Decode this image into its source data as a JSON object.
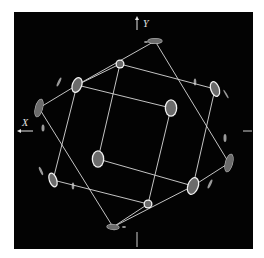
{
  "figure": {
    "background": "#ffffff",
    "panel": {
      "x": 14,
      "y": 12,
      "width": 239,
      "height": 237,
      "color": "#030303"
    },
    "axes": {
      "y": {
        "label": "Y",
        "arrow_x": 137,
        "arrow_y1": 30,
        "arrow_y2": 16,
        "label_x": 143,
        "label_y": 27
      },
      "x": {
        "label": "X",
        "arrow_y": 131,
        "arrow_x1": 33,
        "arrow_x2": 17,
        "label_x": 22,
        "label_y": 126
      },
      "ticks": [
        {
          "x1": 137,
          "y1": 232,
          "x2": 137,
          "y2": 247
        },
        {
          "x1": 243,
          "y1": 131,
          "x2": 252,
          "y2": 131
        }
      ]
    },
    "colors": {
      "line": "#d9d9d9",
      "spot_fill": "#6b6b6b",
      "spot_ring": "#f2f2f2",
      "faint": "#9a9a9a"
    },
    "lines": [
      [
        155,
        41,
        77,
        85
      ],
      [
        77,
        85,
        39,
        108
      ],
      [
        155,
        41,
        229,
        163
      ],
      [
        229,
        163,
        193,
        186
      ],
      [
        193,
        186,
        113,
        227
      ],
      [
        39,
        108,
        113,
        227
      ],
      [
        120,
        64,
        215,
        89
      ],
      [
        120,
        64,
        77,
        85
      ],
      [
        120,
        64,
        98,
        159
      ],
      [
        215,
        89,
        193,
        186
      ],
      [
        77,
        85,
        171,
        108
      ],
      [
        77,
        85,
        53,
        180
      ],
      [
        171,
        108,
        148,
        204
      ],
      [
        98,
        159,
        193,
        186
      ],
      [
        53,
        180,
        148,
        204
      ],
      [
        148,
        204,
        113,
        227
      ]
    ],
    "spots": [
      {
        "name": "spot-top",
        "cx": 155,
        "cy": 41,
        "rx": 7,
        "ry": 2.5,
        "rot": 0,
        "ring": false
      },
      {
        "name": "spot-ring-a",
        "cx": 120,
        "cy": 64,
        "rx": 3.2,
        "ry": 3.2,
        "rot": 0,
        "ring": true
      },
      {
        "name": "spot-b",
        "cx": 77,
        "cy": 85,
        "rx": 4,
        "ry": 7,
        "rot": 20,
        "ring": true
      },
      {
        "name": "spot-far-left",
        "cx": 39,
        "cy": 108,
        "rx": 3.5,
        "ry": 9,
        "rot": 15,
        "ring": false
      },
      {
        "name": "spot-right-top",
        "cx": 215,
        "cy": 89,
        "rx": 3.5,
        "ry": 7,
        "rot": -20,
        "ring": true
      },
      {
        "name": "spot-center-c",
        "cx": 171,
        "cy": 108,
        "rx": 5,
        "ry": 7.5,
        "rot": 0,
        "ring": true
      },
      {
        "name": "spot-center-left",
        "cx": 98,
        "cy": 159,
        "rx": 5,
        "ry": 7.5,
        "rot": 0,
        "ring": true
      },
      {
        "name": "spot-right-bottom",
        "cx": 193,
        "cy": 186,
        "rx": 4.5,
        "ry": 8,
        "rot": 20,
        "ring": true
      },
      {
        "name": "spot-far-right",
        "cx": 229,
        "cy": 163,
        "rx": 3.5,
        "ry": 9,
        "rot": 15,
        "ring": false
      },
      {
        "name": "spot-ring-bottom",
        "cx": 148,
        "cy": 204,
        "rx": 3.2,
        "ry": 3.2,
        "rot": 0,
        "ring": true
      },
      {
        "name": "spot-bottom",
        "cx": 113,
        "cy": 227,
        "rx": 6,
        "ry": 2.5,
        "rot": 5,
        "ring": false
      },
      {
        "name": "spot-left-bottom",
        "cx": 53,
        "cy": 180,
        "rx": 3,
        "ry": 6.5,
        "rot": -20,
        "ring": true
      }
    ],
    "faint_spots": [
      {
        "cx": 59,
        "cy": 82,
        "rx": 1.2,
        "ry": 5,
        "rot": 25
      },
      {
        "cx": 43,
        "cy": 128,
        "rx": 1.5,
        "ry": 3.5,
        "rot": 0
      },
      {
        "cx": 41,
        "cy": 171,
        "rx": 1.2,
        "ry": 4.5,
        "rot": -25
      },
      {
        "cx": 73,
        "cy": 186,
        "rx": 1.3,
        "ry": 3.5,
        "rot": 0
      },
      {
        "cx": 195,
        "cy": 82,
        "rx": 1.3,
        "ry": 3.5,
        "rot": 0
      },
      {
        "cx": 225,
        "cy": 138,
        "rx": 1.5,
        "ry": 4,
        "rot": 0
      },
      {
        "cx": 210,
        "cy": 184,
        "rx": 1.3,
        "ry": 5,
        "rot": 25
      },
      {
        "cx": 226,
        "cy": 94,
        "rx": 0.8,
        "ry": 5,
        "rot": -30
      },
      {
        "cx": 146,
        "cy": 42,
        "rx": 2,
        "ry": 1,
        "rot": 0
      },
      {
        "cx": 124,
        "cy": 227,
        "rx": 2,
        "ry": 1,
        "rot": 0
      }
    ]
  }
}
